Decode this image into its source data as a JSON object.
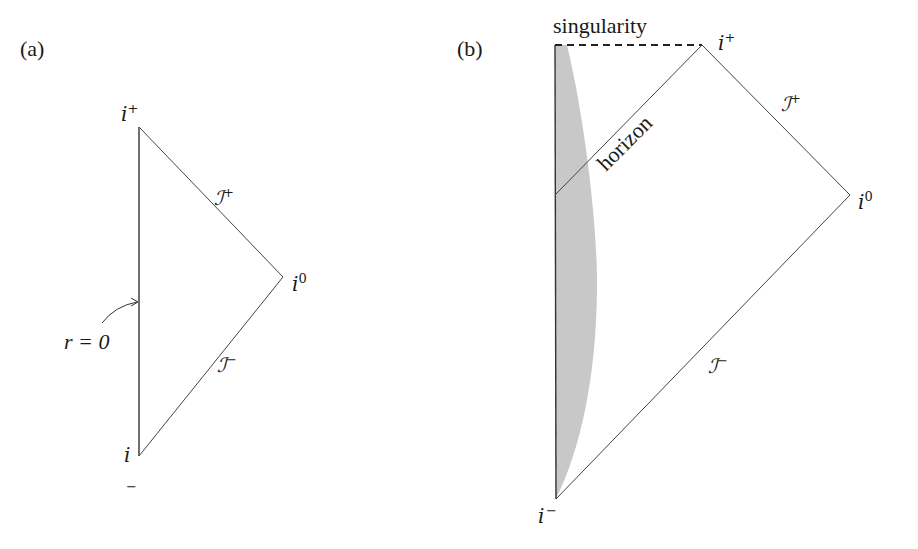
{
  "panel_a": {
    "label": "(a)",
    "vertices": {
      "top": {
        "name": "i+",
        "x": 139,
        "y": 127
      },
      "right": {
        "name": "i0",
        "x": 283,
        "y": 277
      },
      "bottom": {
        "name": "i-",
        "x": 139,
        "y": 456
      }
    },
    "labels": {
      "i_plus": {
        "base": "i",
        "sup": "+"
      },
      "i_zero": {
        "base": "i",
        "sup": "0"
      },
      "i_minus": {
        "base": "i",
        "sup": "−"
      },
      "scri_plus": {
        "base": "ℐ",
        "sup": "+"
      },
      "scri_minus": {
        "base": "ℐ",
        "sup": "−"
      },
      "r_zero": "r = 0"
    }
  },
  "panel_b": {
    "label": "(b)",
    "vertices": {
      "singularity_left": {
        "x": 555,
        "y": 45
      },
      "top": {
        "name": "i+",
        "x": 702,
        "y": 45
      },
      "right": {
        "name": "i0",
        "x": 850,
        "y": 195
      },
      "bottom": {
        "name": "i-",
        "x": 556,
        "y": 499
      },
      "horizon_left": {
        "x": 555,
        "y": 195
      }
    },
    "labels": {
      "singularity": "singularity",
      "horizon": "horizon",
      "i_plus": {
        "base": "i",
        "sup": "+"
      },
      "i_zero": {
        "base": "i",
        "sup": "0"
      },
      "i_minus": {
        "base": "i",
        "sup": "−"
      },
      "scri_plus": {
        "base": "ℐ",
        "sup": "+"
      },
      "scri_minus": {
        "base": "ℐ",
        "sup": "−"
      }
    },
    "collapsing_matter_fill": "#c8c8c8"
  },
  "colors": {
    "line": "#333333",
    "text": "#1a1a1a",
    "background": "#ffffff"
  }
}
